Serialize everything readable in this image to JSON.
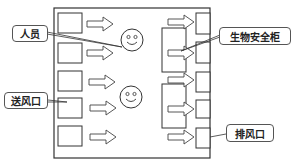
{
  "diagram": {
    "type": "room-airflow-layout",
    "labels": {
      "personnel": "人员",
      "biosafety_cabinet": "生物安全柜",
      "supply_vent": "送风口",
      "exhaust_vent": "排风口"
    },
    "supply_vents_count": 5,
    "exhaust_vents_count": 5,
    "personnel_count": 2,
    "cabinets_count": 2,
    "colors": {
      "stroke": "#333333",
      "background": "#ffffff"
    }
  }
}
